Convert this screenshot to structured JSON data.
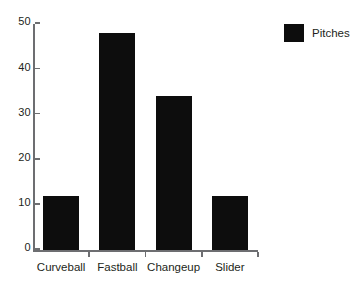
{
  "chart_data": {
    "type": "bar",
    "title": "",
    "subtitle": "",
    "xlabel": "",
    "ylabel": "",
    "categories": [
      "Curveball",
      "Fastball",
      "Changeup",
      "Slider"
    ],
    "values": [
      12,
      48,
      34,
      12
    ],
    "series": [
      {
        "name": "Pitches",
        "values": [
          12,
          48,
          34,
          12
        ]
      }
    ],
    "ylim": [
      0,
      50
    ],
    "y_ticks": [
      0,
      10,
      20,
      30,
      40,
      50
    ],
    "y_tick_labels": [
      "0",
      "10",
      "20",
      "30",
      "40",
      "50"
    ],
    "grid": false,
    "legend": {
      "position": "top-right",
      "entries": [
        {
          "label": "Pitches",
          "color": "#0d0d0d"
        }
      ]
    },
    "bar_color": "#0d0d0d",
    "axis_color": "#6d6e71",
    "background": "#ffffff",
    "text_color": "#231f20"
  }
}
